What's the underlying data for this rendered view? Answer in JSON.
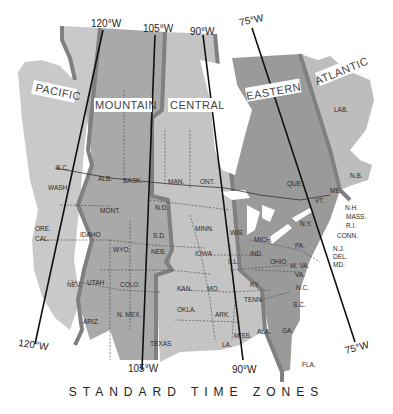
{
  "title": "STANDARD TIME ZONES",
  "colors": {
    "pacific": "#c9c9c9",
    "mountain": "#a9a9a9",
    "central": "#c4c4c4",
    "eastern": "#9a9a9a",
    "atlantic": "#bdbdbd",
    "boundary": "#808080",
    "water": "#ffffff",
    "meridian": "#111111"
  },
  "zones": [
    {
      "name": "PACIFIC"
    },
    {
      "name": "MOUNTAIN"
    },
    {
      "name": "CENTRAL"
    },
    {
      "name": "EASTERN"
    },
    {
      "name": "ATLANTIC"
    }
  ],
  "meridians": [
    {
      "label_top": "120°W",
      "label_bottom": "120°W"
    },
    {
      "label_top": "105°W",
      "label_bottom": "105°W"
    },
    {
      "label_top": "90°W",
      "label_bottom": "90°W"
    },
    {
      "label_top": "75°W",
      "label_bottom": "75°W"
    }
  ],
  "regions": {
    "canada": [
      "B.C.",
      "ALB.",
      "SASK.",
      "MAN.",
      "ONT.",
      "QUE.",
      "LAB.",
      "N.B."
    ],
    "us_west": [
      "WASH.",
      "ORE.",
      "CAL.",
      "NEV.",
      "IDAHO",
      "MONT.",
      "WYO.",
      "UTAH",
      "COLO.",
      "ARIZ.",
      "N. MEX."
    ],
    "us_central": [
      "N.D.",
      "S.D.",
      "NEB.",
      "KAN.",
      "OKLA.",
      "TEXAS",
      "MINN.",
      "IOWA",
      "MO.",
      "ARK.",
      "LA.",
      "WIS.",
      "ILL.",
      "MISS.",
      "ALA.",
      "TENN.",
      "KY."
    ],
    "us_east": [
      "MICH.",
      "IND.",
      "OHIO",
      "PA.",
      "N.Y.",
      "W. VA.",
      "VA.",
      "N.C.",
      "S.C.",
      "GA.",
      "FLA.",
      "VT.",
      "ME.",
      "N.H.",
      "MASS.",
      "R.I.",
      "CONN.",
      "N.J.",
      "DEL.",
      "MD."
    ]
  }
}
